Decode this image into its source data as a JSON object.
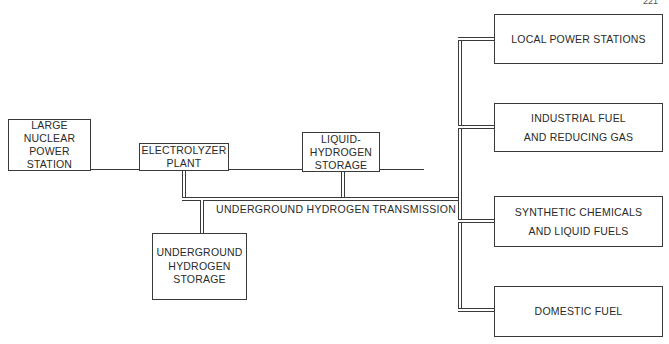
{
  "page": {
    "number": "221"
  },
  "diagram": {
    "nodes": {
      "nuclear": {
        "label": "LARGE\nNUCLEAR\nPOWER\nSTATION"
      },
      "electrolyzer": {
        "label": "ELECTROLYZER\nPLANT"
      },
      "liquid_storage": {
        "label": "LIQUID-\nHYDROGEN\nSTORAGE"
      },
      "underground_storage": {
        "label": "UNDERGROUND\nHYDROGEN\nSTORAGE"
      },
      "local_power": {
        "label": "LOCAL POWER STATIONS"
      },
      "industrial": {
        "label": "INDUSTRIAL FUEL\nAND REDUCING GAS"
      },
      "synthetic": {
        "label": "SYNTHETIC CHEMICALS\nAND LIQUID FUELS"
      },
      "domestic": {
        "label": "DOMESTIC FUEL"
      }
    },
    "pipeline_label": "UNDERGROUND HYDROGEN TRANSMISSION",
    "edges": [
      {
        "from": "nuclear",
        "to": "electrolyzer",
        "type": "power-line"
      },
      {
        "from": "electrolyzer",
        "to": "liquid_storage",
        "type": "power-line"
      },
      {
        "from": "electrolyzer",
        "to": "transmission",
        "type": "pipeline"
      },
      {
        "from": "liquid_storage",
        "to": "transmission",
        "type": "pipeline"
      },
      {
        "from": "transmission",
        "to": "underground_storage",
        "type": "pipeline"
      },
      {
        "from": "transmission",
        "to": "local_power",
        "type": "pipeline"
      },
      {
        "from": "transmission",
        "to": "industrial",
        "type": "pipeline"
      },
      {
        "from": "transmission",
        "to": "synthetic",
        "type": "pipeline"
      },
      {
        "from": "transmission",
        "to": "domestic",
        "type": "pipeline"
      }
    ]
  }
}
